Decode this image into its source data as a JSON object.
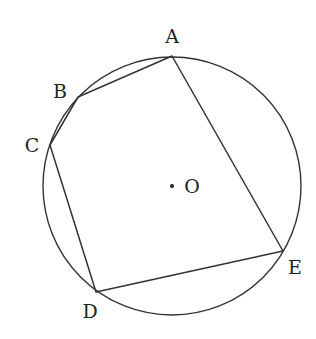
{
  "diagram": {
    "type": "inscribed-pentagon",
    "stroke_color": "#333333",
    "circle": {
      "center_label": "O",
      "cx": 172,
      "cy": 186,
      "r": 129
    },
    "points": [
      {
        "label": "A",
        "x": 172,
        "y": 56,
        "lx": 172,
        "ly": 43
      },
      {
        "label": "B",
        "x": 78,
        "y": 97,
        "lx": 60,
        "ly": 98
      },
      {
        "label": "C",
        "x": 50,
        "y": 145,
        "lx": 32,
        "ly": 152
      },
      {
        "label": "D",
        "x": 96,
        "y": 292,
        "lx": 90,
        "ly": 318
      },
      {
        "label": "E",
        "x": 283,
        "y": 251,
        "lx": 295,
        "ly": 274
      }
    ],
    "center_point": {
      "label": "O",
      "x": 172,
      "y": 186,
      "lx": 192,
      "ly": 193
    }
  }
}
